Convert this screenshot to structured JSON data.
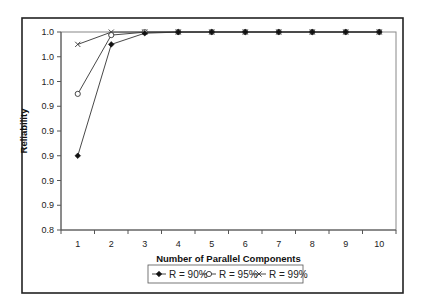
{
  "chart_data": {
    "type": "line",
    "title": "",
    "xlabel": "Number of Parallel Components",
    "ylabel": "Reliability",
    "categories": [
      "1",
      "2",
      "3",
      "4",
      "5",
      "6",
      "7",
      "8",
      "9",
      "10"
    ],
    "ylim": [
      0.84,
      1.0
    ],
    "yticks": [
      0.84,
      0.86,
      0.88,
      0.9,
      0.92,
      0.94,
      0.96,
      0.98,
      1.0
    ],
    "ytick_labels": [
      "0.8",
      "0.9",
      "0.9",
      "0.9",
      "0.9",
      "0.9",
      "1.0",
      "1.0",
      "1.0"
    ],
    "grid": false,
    "legend_position": "bottom",
    "series": [
      {
        "name": "R = 90%",
        "marker": "diamond-filled",
        "values": [
          0.9,
          0.99,
          0.999,
          0.9999,
          0.99999,
          1.0,
          1.0,
          1.0,
          1.0,
          1.0
        ]
      },
      {
        "name": "R = 95%",
        "marker": "circle-open",
        "values": [
          0.95,
          0.9975,
          0.999875,
          0.99999,
          1.0,
          1.0,
          1.0,
          1.0,
          1.0,
          1.0
        ]
      },
      {
        "name": "R = 99%",
        "marker": "x",
        "values": [
          0.99,
          0.9999,
          0.999999,
          1.0,
          1.0,
          1.0,
          1.0,
          1.0,
          1.0,
          1.0
        ]
      }
    ]
  },
  "colors": {
    "line": "#333333",
    "frame": "#222222",
    "axis": "#777777"
  }
}
